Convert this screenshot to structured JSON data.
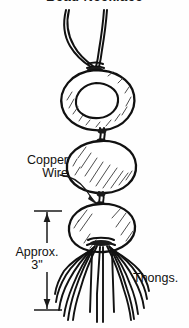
{
  "figure": {
    "title": "Bead Necklace",
    "alt_description": "Hand-drawn line illustration of a three-bead necklace on a cord, with leather thongs hanging from the bottom bead",
    "background_color": "#fefefe",
    "ink_color": "#1a1a1a"
  },
  "labels": {
    "copper_wire": {
      "line1": "Copper",
      "line2": "Wire"
    },
    "approx_dimension": {
      "line1": "Approx.",
      "line2": "3\""
    },
    "thongs": "Thongs."
  },
  "parts": {
    "cord": "neck-cord",
    "bead_top": "ring-bead",
    "bead_middle": "round-bead",
    "bead_bottom": "round-bead",
    "wire_loops": "copper-wire-connectors",
    "fringe": "leather-thongs"
  },
  "dimension": {
    "value": "3\"",
    "qualifier": "Approx.",
    "measures": "thong-length"
  }
}
